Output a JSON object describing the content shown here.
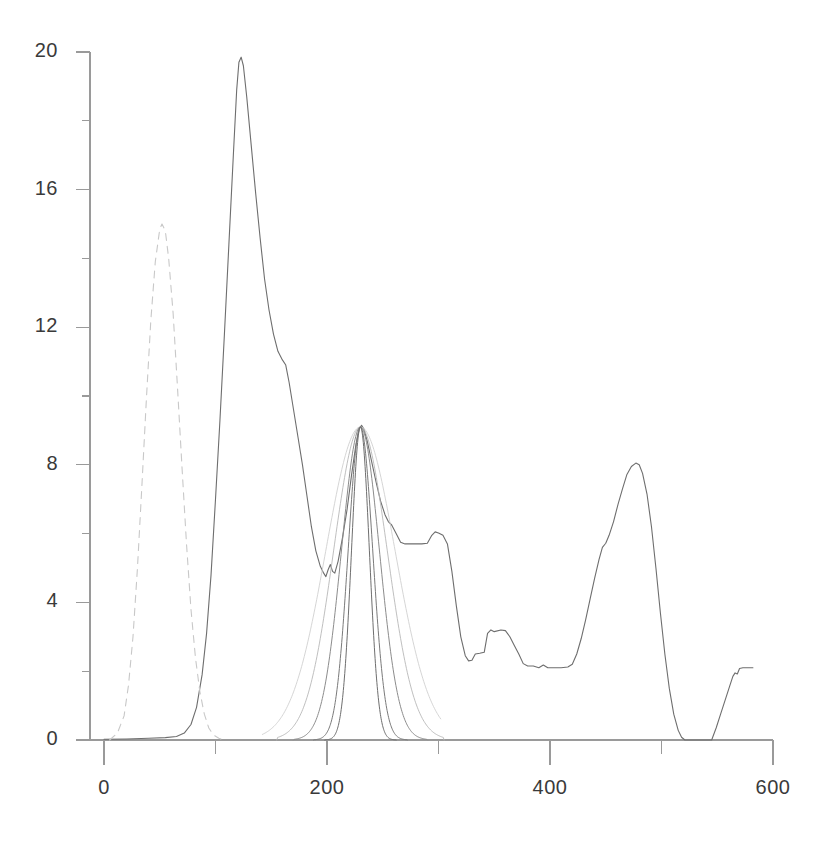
{
  "chart_data": {
    "type": "line",
    "title": "",
    "subtitle": "",
    "xlabel": "",
    "ylabel": "",
    "xlim": [
      0,
      600
    ],
    "ylim": [
      0,
      20
    ],
    "grid": false,
    "legend": "none",
    "x_ticks": [
      0,
      200,
      400,
      600
    ],
    "x_tick_labels": [
      "0",
      "200",
      "400",
      "600"
    ],
    "x_minor_ticks": [
      100,
      300,
      500
    ],
    "y_ticks": [
      0,
      4,
      8,
      12,
      16,
      20
    ],
    "y_tick_labels": [
      "0",
      "4",
      "8",
      "12",
      "16",
      "20"
    ],
    "y_minor_ticks": [
      2,
      6,
      10,
      14,
      18
    ],
    "annotations": [],
    "series": [
      {
        "name": "measured-spectrum",
        "style": "solid",
        "color": "#6e6e6e",
        "width": 1.1,
        "points": [
          [
            0,
            0.02
          ],
          [
            20,
            0.03
          ],
          [
            40,
            0.05
          ],
          [
            55,
            0.07
          ],
          [
            65,
            0.1
          ],
          [
            72,
            0.2
          ],
          [
            78,
            0.45
          ],
          [
            83,
            0.95
          ],
          [
            88,
            1.9
          ],
          [
            92,
            3.1
          ],
          [
            96,
            4.8
          ],
          [
            100,
            7.0
          ],
          [
            104,
            9.3
          ],
          [
            108,
            11.8
          ],
          [
            112,
            14.4
          ],
          [
            116,
            17.0
          ],
          [
            119,
            18.9
          ],
          [
            121,
            19.7
          ],
          [
            123,
            19.85
          ],
          [
            125,
            19.6
          ],
          [
            128,
            18.7
          ],
          [
            132,
            17.3
          ],
          [
            136,
            15.9
          ],
          [
            140,
            14.6
          ],
          [
            144,
            13.4
          ],
          [
            148,
            12.5
          ],
          [
            152,
            11.8
          ],
          [
            156,
            11.3
          ],
          [
            160,
            11.05
          ],
          [
            163,
            10.9
          ],
          [
            166,
            10.4
          ],
          [
            170,
            9.6
          ],
          [
            174,
            8.8
          ],
          [
            178,
            8.0
          ],
          [
            182,
            7.1
          ],
          [
            186,
            6.2
          ],
          [
            190,
            5.5
          ],
          [
            194,
            5.05
          ],
          [
            197,
            4.85
          ],
          [
            199,
            4.75
          ],
          [
            201,
            4.95
          ],
          [
            203,
            5.1
          ],
          [
            205,
            4.9
          ],
          [
            207,
            4.85
          ],
          [
            210,
            5.2
          ],
          [
            214,
            5.9
          ],
          [
            218,
            6.7
          ],
          [
            222,
            7.7
          ],
          [
            226,
            8.6
          ],
          [
            229,
            9.05
          ],
          [
            231,
            9.15
          ],
          [
            233,
            9.05
          ],
          [
            236,
            8.7
          ],
          [
            240,
            8.1
          ],
          [
            244,
            7.5
          ],
          [
            248,
            6.95
          ],
          [
            252,
            6.55
          ],
          [
            255,
            6.35
          ],
          [
            258,
            6.25
          ],
          [
            262,
            6.0
          ],
          [
            266,
            5.75
          ],
          [
            270,
            5.7
          ],
          [
            275,
            5.7
          ],
          [
            280,
            5.7
          ],
          [
            285,
            5.7
          ],
          [
            290,
            5.72
          ],
          [
            294,
            5.95
          ],
          [
            297,
            6.05
          ],
          [
            300,
            6.02
          ],
          [
            304,
            5.95
          ],
          [
            308,
            5.7
          ],
          [
            312,
            4.9
          ],
          [
            316,
            3.9
          ],
          [
            320,
            3.0
          ],
          [
            324,
            2.45
          ],
          [
            327,
            2.3
          ],
          [
            330,
            2.32
          ],
          [
            333,
            2.5
          ],
          [
            337,
            2.52
          ],
          [
            341,
            2.55
          ],
          [
            344,
            3.1
          ],
          [
            347,
            3.2
          ],
          [
            350,
            3.15
          ],
          [
            356,
            3.2
          ],
          [
            360,
            3.18
          ],
          [
            364,
            3.0
          ],
          [
            368,
            2.75
          ],
          [
            372,
            2.5
          ],
          [
            376,
            2.22
          ],
          [
            380,
            2.15
          ],
          [
            385,
            2.15
          ],
          [
            390,
            2.1
          ],
          [
            394,
            2.18
          ],
          [
            398,
            2.1
          ],
          [
            404,
            2.1
          ],
          [
            410,
            2.1
          ],
          [
            416,
            2.12
          ],
          [
            420,
            2.2
          ],
          [
            424,
            2.5
          ],
          [
            428,
            2.95
          ],
          [
            432,
            3.5
          ],
          [
            436,
            4.1
          ],
          [
            440,
            4.7
          ],
          [
            444,
            5.25
          ],
          [
            447,
            5.6
          ],
          [
            450,
            5.72
          ],
          [
            453,
            5.95
          ],
          [
            457,
            6.35
          ],
          [
            461,
            6.85
          ],
          [
            465,
            7.3
          ],
          [
            469,
            7.72
          ],
          [
            473,
            7.95
          ],
          [
            477,
            8.05
          ],
          [
            480,
            8.0
          ],
          [
            483,
            7.75
          ],
          [
            487,
            7.15
          ],
          [
            491,
            6.2
          ],
          [
            495,
            5.0
          ],
          [
            499,
            3.7
          ],
          [
            503,
            2.5
          ],
          [
            507,
            1.5
          ],
          [
            511,
            0.75
          ],
          [
            515,
            0.28
          ],
          [
            518,
            0.08
          ],
          [
            521,
            0.0
          ],
          [
            545,
            0.0
          ],
          [
            549,
            0.35
          ],
          [
            553,
            0.75
          ],
          [
            557,
            1.15
          ],
          [
            561,
            1.55
          ],
          [
            564,
            1.85
          ],
          [
            566,
            1.95
          ],
          [
            568,
            1.92
          ],
          [
            570,
            2.08
          ],
          [
            573,
            2.1
          ],
          [
            578,
            2.1
          ],
          [
            582,
            2.1
          ]
        ]
      },
      {
        "name": "reference-gaussian-dashed",
        "style": "dashed",
        "color": "#c8c8c8",
        "width": 1.1,
        "peak_x": 52,
        "peak_y": 15.0,
        "points": [
          [
            5,
            0.0
          ],
          [
            12,
            0.2
          ],
          [
            18,
            0.7
          ],
          [
            22,
            1.6
          ],
          [
            26,
            3.0
          ],
          [
            30,
            5.0
          ],
          [
            34,
            7.4
          ],
          [
            38,
            9.9
          ],
          [
            42,
            12.2
          ],
          [
            46,
            13.9
          ],
          [
            50,
            14.85
          ],
          [
            52,
            15.0
          ],
          [
            55,
            14.8
          ],
          [
            58,
            14.0
          ],
          [
            62,
            12.4
          ],
          [
            66,
            10.2
          ],
          [
            70,
            7.9
          ],
          [
            74,
            5.7
          ],
          [
            78,
            3.8
          ],
          [
            82,
            2.4
          ],
          [
            86,
            1.4
          ],
          [
            90,
            0.75
          ],
          [
            94,
            0.35
          ],
          [
            98,
            0.15
          ],
          [
            103,
            0.05
          ],
          [
            108,
            0.0
          ]
        ]
      },
      {
        "name": "fit-gaussian-widest",
        "style": "solid",
        "color": "#d0d0d0",
        "width": 0.9,
        "peak_x": 230,
        "peak_y": 9.1,
        "sigma": 31,
        "x_start": 142,
        "x_end": 302,
        "truncated_end_y": 1.5
      },
      {
        "name": "fit-gaussian-wide",
        "style": "solid",
        "color": "#b8b8b8",
        "width": 0.9,
        "peak_x": 230,
        "peak_y": 9.1,
        "sigma": 24,
        "x_start": 155,
        "x_end": 305
      },
      {
        "name": "fit-gaussian-medium",
        "style": "solid",
        "color": "#8c8c8c",
        "width": 1.0,
        "peak_x": 230,
        "peak_y": 9.1,
        "sigma": 17,
        "x_start": 170,
        "x_end": 290
      },
      {
        "name": "fit-gaussian-narrow",
        "style": "solid",
        "color": "#7a7a7a",
        "width": 1.0,
        "peak_x": 230,
        "peak_y": 9.1,
        "sigma": 11,
        "x_start": 188,
        "x_end": 272
      },
      {
        "name": "fit-gaussian-narrowest",
        "style": "solid",
        "color": "#6e6e6e",
        "width": 1.0,
        "peak_x": 230,
        "peak_y": 9.1,
        "sigma": 8,
        "x_start": 198,
        "x_end": 262
      }
    ]
  },
  "axes": {
    "axis_color": "#9a9a9a",
    "x_origin_px": 104,
    "x_end_px": 773,
    "y_zero_px": 740,
    "y_top_px": 52
  }
}
